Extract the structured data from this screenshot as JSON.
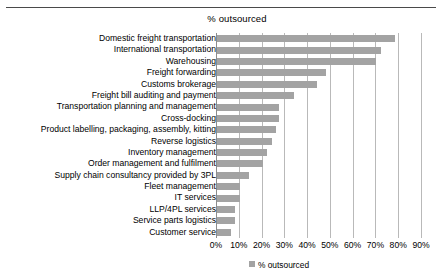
{
  "chart_data": {
    "type": "bar",
    "orientation": "horizontal",
    "title": "% outsourced",
    "xlabel": "",
    "ylabel": "",
    "xlim": [
      0,
      90
    ],
    "grid": true,
    "legend_position": "bottom",
    "legend": [
      "% outsourced"
    ],
    "xtick_labels": [
      "0%",
      "10%",
      "20%",
      "30%",
      "40%",
      "50%",
      "60%",
      "70%",
      "80%",
      "90%"
    ],
    "xtick_values": [
      0,
      10,
      20,
      30,
      40,
      50,
      60,
      70,
      80,
      90
    ],
    "categories": [
      "Domestic freight transportation",
      "International transportation",
      "Warehousing",
      "Freight forwarding",
      "Customs brokerage",
      "Freight bill auditing and payment",
      "Transportation planning and management",
      "Cross-docking",
      "Product labelling, packaging, assembly, kitting",
      "Reverse logistics",
      "Inventory management",
      "Order management and fulfilment",
      "Supply chain consultancy provided by 3PL",
      "Fleet management",
      "IT services",
      "LLP/4PL services",
      "Service parts logistics",
      "Customer service"
    ],
    "values": [
      78,
      72,
      70,
      48,
      44,
      34,
      27,
      27,
      26,
      24,
      22,
      20,
      14,
      10,
      10,
      8,
      8,
      6
    ],
    "series": [
      {
        "name": "% outsourced",
        "values": [
          78,
          72,
          70,
          48,
          44,
          34,
          27,
          27,
          26,
          24,
          22,
          20,
          14,
          10,
          10,
          8,
          8,
          6
        ]
      }
    ]
  },
  "colors": {
    "bar": "#a3a3a3",
    "gridline": "#b9b9b9",
    "axis": "#8c8c8c",
    "rule": "#4a4a4a",
    "text": "#000000",
    "background": "#ffffff"
  }
}
